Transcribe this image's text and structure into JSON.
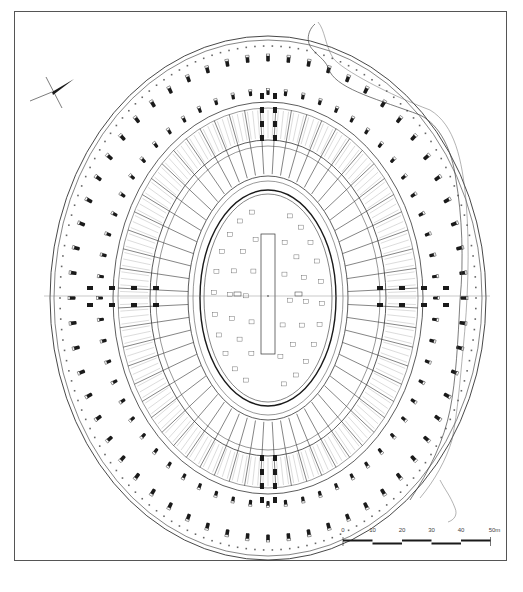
{
  "figure": {
    "type": "architectural-plan"
  },
  "scale_bar": {
    "unit": "m",
    "ticks": [
      "0",
      "10",
      "20",
      "30",
      "40",
      "50m"
    ]
  },
  "north_arrow": {
    "icon": "north-arrow-icon"
  },
  "colors": {
    "ink": "#1a1a1a",
    "line": "#333333",
    "frame": "#555555",
    "paper": "#ffffff"
  }
}
